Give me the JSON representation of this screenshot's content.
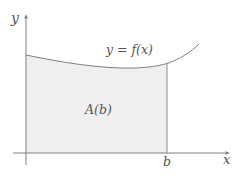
{
  "diagram": {
    "title": "",
    "axes": {
      "x_label": "x",
      "y_label": "y",
      "color": "#808080"
    },
    "curve": {
      "label": "y = f(x)",
      "color": "#808080"
    },
    "region": {
      "label": "A(b)",
      "fill": "#efefef"
    },
    "bound": {
      "label": "b",
      "color": "#808080"
    }
  }
}
